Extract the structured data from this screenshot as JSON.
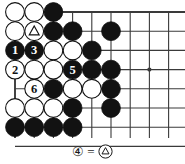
{
  "figure": {
    "type": "go-board-diagram",
    "title": "",
    "board": {
      "cols": 9,
      "rows": 9,
      "x0": 15,
      "y0": 12,
      "step": 19.2,
      "edges": {
        "left": true,
        "top": true,
        "right": false,
        "bottom": false
      },
      "line_color": "#3a3a3a",
      "star_points": [
        {
          "col": 8,
          "row": 4
        }
      ]
    },
    "stones": [
      {
        "col": 1,
        "row": 1,
        "color": "white",
        "label": ""
      },
      {
        "col": 2,
        "row": 1,
        "color": "white",
        "label": ""
      },
      {
        "col": 3,
        "row": 1,
        "color": "black",
        "label": ""
      },
      {
        "col": 1,
        "row": 2,
        "color": "white",
        "label": ""
      },
      {
        "col": 2,
        "row": 2,
        "color": "white",
        "label": "triangle"
      },
      {
        "col": 3,
        "row": 2,
        "color": "black",
        "label": ""
      },
      {
        "col": 4,
        "row": 2,
        "color": "black",
        "label": ""
      },
      {
        "col": 6,
        "row": 2,
        "color": "black",
        "label": ""
      },
      {
        "col": 1,
        "row": 3,
        "color": "black",
        "label": "1"
      },
      {
        "col": 2,
        "row": 3,
        "color": "black",
        "label": "3"
      },
      {
        "col": 3,
        "row": 3,
        "color": "white",
        "label": ""
      },
      {
        "col": 4,
        "row": 3,
        "color": "white",
        "label": ""
      },
      {
        "col": 5,
        "row": 3,
        "color": "black",
        "label": ""
      },
      {
        "col": 1,
        "row": 4,
        "color": "white",
        "label": "2"
      },
      {
        "col": 2,
        "row": 4,
        "color": "white",
        "label": ""
      },
      {
        "col": 3,
        "row": 4,
        "color": "white",
        "label": ""
      },
      {
        "col": 4,
        "row": 4,
        "color": "black",
        "label": "5"
      },
      {
        "col": 5,
        "row": 4,
        "color": "black",
        "label": ""
      },
      {
        "col": 6,
        "row": 4,
        "color": "black",
        "label": ""
      },
      {
        "col": 2,
        "row": 5,
        "color": "white",
        "label": "6"
      },
      {
        "col": 3,
        "row": 5,
        "color": "black",
        "label": ""
      },
      {
        "col": 4,
        "row": 5,
        "color": "white",
        "label": ""
      },
      {
        "col": 5,
        "row": 5,
        "color": "white",
        "label": ""
      },
      {
        "col": 6,
        "row": 5,
        "color": "black",
        "label": ""
      },
      {
        "col": 1,
        "row": 6,
        "color": "white",
        "label": ""
      },
      {
        "col": 2,
        "row": 6,
        "color": "white",
        "label": ""
      },
      {
        "col": 3,
        "row": 6,
        "color": "white",
        "label": ""
      },
      {
        "col": 4,
        "row": 6,
        "color": "black",
        "label": ""
      },
      {
        "col": 6,
        "row": 6,
        "color": "black",
        "label": ""
      },
      {
        "col": 1,
        "row": 7,
        "color": "black",
        "label": ""
      },
      {
        "col": 2,
        "row": 7,
        "color": "black",
        "label": ""
      },
      {
        "col": 3,
        "row": 7,
        "color": "black",
        "label": ""
      },
      {
        "col": 4,
        "row": 7,
        "color": "black",
        "label": ""
      }
    ],
    "caption": {
      "move_marker": "④",
      "equals": "=",
      "stone_marker": "△",
      "text": "④ = △"
    }
  }
}
